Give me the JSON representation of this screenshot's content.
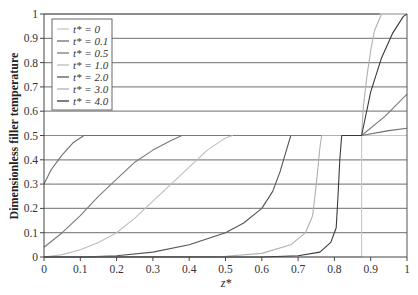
{
  "chart_data": {
    "type": "line",
    "title": "",
    "xlabel": "z*",
    "ylabel": "Dimensionless filler temperature",
    "xlim": [
      0,
      1
    ],
    "ylim": [
      0,
      1
    ],
    "xticks": [
      "0",
      "0.1",
      "0.2",
      "0.3",
      "0.4",
      "0.5",
      "0.6",
      "0.7",
      "0.8",
      "0.9",
      "1"
    ],
    "yticks": [
      "0",
      "0.1",
      "0.2",
      "0.3",
      "0.4",
      "0.5",
      "0.6",
      "0.7",
      "0.8",
      "0.9",
      "1"
    ],
    "grid": "horizontal",
    "legend_position": "upper-left",
    "series": [
      {
        "name": "t* = 0",
        "color": "#c8c8c8",
        "x": [
          0,
          0.875,
          0.875,
          1.0
        ],
        "y": [
          0,
          0,
          0.5,
          0.5
        ]
      },
      {
        "name": "t* = 0.1",
        "color": "#6e6e6e",
        "x": [
          0,
          0.02,
          0.05,
          0.08,
          0.11,
          0.875,
          0.95,
          1.0
        ],
        "y": [
          0.3,
          0.36,
          0.42,
          0.47,
          0.5,
          0.5,
          0.52,
          0.53
        ]
      },
      {
        "name": "t* = 0.5",
        "color": "#7a7a7a",
        "x": [
          0,
          0.05,
          0.1,
          0.15,
          0.2,
          0.25,
          0.3,
          0.35,
          0.38,
          0.875,
          0.94,
          1.0
        ],
        "y": [
          0.04,
          0.1,
          0.17,
          0.25,
          0.32,
          0.39,
          0.44,
          0.48,
          0.5,
          0.5,
          0.58,
          0.67
        ]
      },
      {
        "name": "t* = 1.0",
        "color": "#bdbdbd",
        "x": [
          0,
          0.05,
          0.1,
          0.15,
          0.2,
          0.25,
          0.3,
          0.35,
          0.4,
          0.45,
          0.5,
          0.52
        ],
        "y": [
          0,
          0.01,
          0.03,
          0.06,
          0.1,
          0.16,
          0.23,
          0.3,
          0.37,
          0.44,
          0.49,
          0.5
        ]
      },
      {
        "name": "t* = 2.0",
        "color": "#555555",
        "x": [
          0,
          0.1,
          0.2,
          0.3,
          0.4,
          0.5,
          0.55,
          0.6,
          0.63,
          0.65,
          0.67,
          0.68
        ],
        "y": [
          0,
          0,
          0.005,
          0.02,
          0.05,
          0.1,
          0.14,
          0.2,
          0.27,
          0.35,
          0.45,
          0.5
        ]
      },
      {
        "name": "t* = 3.0",
        "color": "#b0b0b0",
        "x": [
          0,
          0.5,
          0.6,
          0.68,
          0.72,
          0.74,
          0.75,
          0.76,
          0.765,
          0.875,
          0.88,
          0.89,
          0.9,
          0.91,
          0.93
        ],
        "y": [
          0,
          0.003,
          0.015,
          0.05,
          0.1,
          0.17,
          0.3,
          0.45,
          0.5,
          0.5,
          0.62,
          0.75,
          0.85,
          0.93,
          1.0
        ]
      },
      {
        "name": "t* = 4.0",
        "color": "#3a3a3a",
        "x": [
          0,
          0.6,
          0.7,
          0.76,
          0.79,
          0.805,
          0.81,
          0.815,
          0.82,
          0.875,
          0.9,
          0.93,
          0.96,
          0.99,
          1.0
        ],
        "y": [
          0,
          0,
          0.005,
          0.02,
          0.06,
          0.12,
          0.25,
          0.4,
          0.5,
          0.5,
          0.68,
          0.82,
          0.92,
          0.99,
          1.0
        ]
      },
      {
        "name": "upper-bound",
        "color": "#555555",
        "x": [
          0,
          0.925
        ],
        "y": [
          1.0,
          1.0
        ]
      }
    ]
  },
  "legend": {
    "items": [
      {
        "label": "t* = 0",
        "color": "#c8c8c8"
      },
      {
        "label": "t* = 0.1",
        "color": "#6e6e6e"
      },
      {
        "label": "t* = 0.5",
        "color": "#7a7a7a"
      },
      {
        "label": "t* = 1.0",
        "color": "#bdbdbd"
      },
      {
        "label": "t* = 2.0",
        "color": "#555555"
      },
      {
        "label": "t* = 3.0",
        "color": "#b0b0b0"
      },
      {
        "label": "t* = 4.0",
        "color": "#3a3a3a"
      }
    ]
  }
}
